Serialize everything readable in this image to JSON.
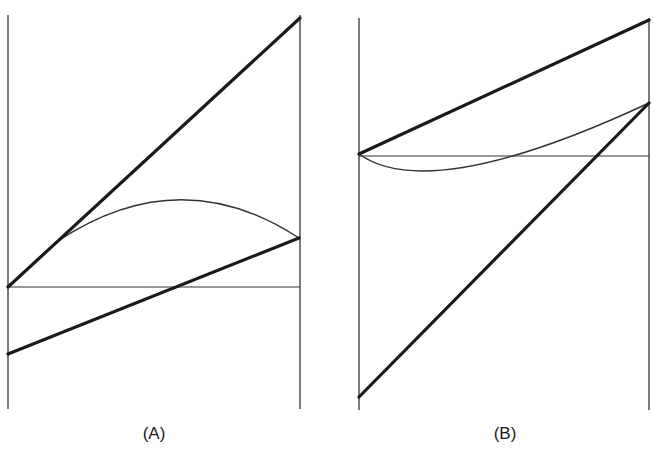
{
  "colors": {
    "ink": "#1a1a1a",
    "thin": "#333333",
    "background": "#ffffff"
  },
  "panels": [
    {
      "label": "(A)",
      "label_pos": {
        "x": 154,
        "y": 424
      },
      "bounds": {
        "left_x": 8,
        "right_x": 300,
        "top_y": 15,
        "bottom_y": 409
      },
      "baseline_y": 287,
      "heavy_lines": [
        {
          "x1": 8,
          "y1": 287,
          "x2": 300,
          "y2": 18
        },
        {
          "x1": 8,
          "y1": 354,
          "x2": 299,
          "y2": 238
        }
      ],
      "curve_path": "M 58 241 Q 180 160 299 238"
    },
    {
      "label": "(B)",
      "label_pos": {
        "x": 505,
        "y": 424
      },
      "bounds": {
        "left_x": 359,
        "right_x": 649,
        "top_y": 18,
        "bottom_y": 410
      },
      "baseline_y": 156,
      "heavy_lines": [
        {
          "x1": 359,
          "y1": 154,
          "x2": 649,
          "y2": 20
        },
        {
          "x1": 359,
          "y1": 397,
          "x2": 649,
          "y2": 103
        }
      ],
      "curve_path": "M 359 154 Q 430 205 649 103"
    }
  ]
}
